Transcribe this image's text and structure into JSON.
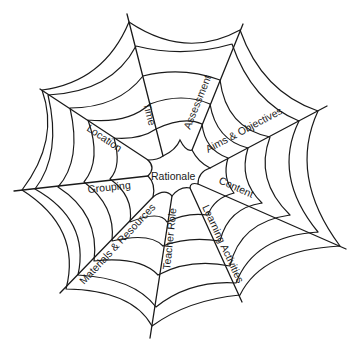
{
  "diagram": {
    "type": "spider-web",
    "center_label": "Rationale",
    "spokes": [
      {
        "label": "Time"
      },
      {
        "label": "Assessment"
      },
      {
        "label": "Aims & Objectives"
      },
      {
        "label": "Content"
      },
      {
        "label": "Learning Activities"
      },
      {
        "label": "Teacher Role"
      },
      {
        "label": "Materials & Resources"
      },
      {
        "label": "Grouping"
      },
      {
        "label": "Location"
      }
    ]
  }
}
